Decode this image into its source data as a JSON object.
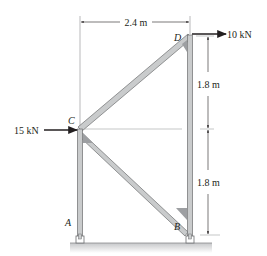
{
  "diagram": {
    "type": "truss-frame",
    "points": {
      "A": {
        "label": "A"
      },
      "B": {
        "label": "B"
      },
      "C": {
        "label": "C"
      },
      "D": {
        "label": "D"
      }
    },
    "members": [
      {
        "from": "A",
        "to": "C"
      },
      {
        "from": "C",
        "to": "D"
      },
      {
        "from": "C",
        "to": "B"
      },
      {
        "from": "B",
        "to": "D"
      }
    ],
    "loads": [
      {
        "point": "D",
        "direction": "right",
        "label": "10 kN"
      },
      {
        "point": "C",
        "direction": "right",
        "label": "15 kN"
      }
    ],
    "dimensions": {
      "horizontal": {
        "label": "2.4 m"
      },
      "vertical_upper": {
        "label": "1.8 m"
      },
      "vertical_lower": {
        "label": "1.8 m"
      }
    },
    "colors": {
      "member_fill": "#c9cbcc",
      "member_edge": "#6d6e70",
      "gusset": "#9d9fa2",
      "ink": "#231f20",
      "dim_line": "#8a8c8e",
      "ground": "#d9dadb"
    }
  }
}
